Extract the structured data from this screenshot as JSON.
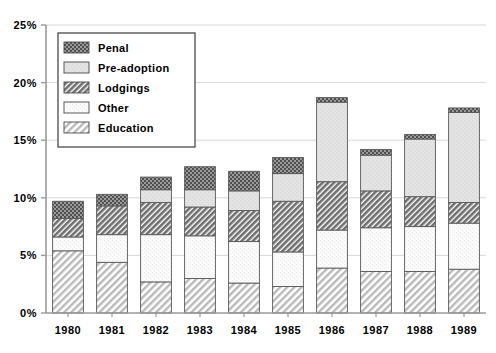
{
  "chart_data": {
    "type": "bar",
    "subtype": "stacked-vertical",
    "title": "",
    "xlabel": "",
    "ylabel": "",
    "categories": [
      "1980",
      "1981",
      "1982",
      "1983",
      "1984",
      "1985",
      "1986",
      "1987",
      "1988",
      "1989"
    ],
    "ylim": [
      0,
      25
    ],
    "ytick_labels": [
      "0%",
      "5%",
      "10%",
      "15%",
      "20%",
      "25%"
    ],
    "ytick_values": [
      0,
      5,
      10,
      15,
      20,
      25
    ],
    "yunit": "%",
    "grid": "horizontal",
    "legend_position": "upper-left-inside",
    "stack_order_bottom_to_top": [
      "Education",
      "Other",
      "Lodgings",
      "Pre-adoption",
      "Penal"
    ],
    "series": [
      {
        "name": "Education",
        "pattern": "diagonal-hatch-light",
        "color": "#d6d6d6",
        "values": [
          5.4,
          4.4,
          2.7,
          3.0,
          2.6,
          2.3,
          3.9,
          3.6,
          3.6,
          3.8
        ]
      },
      {
        "name": "Other",
        "pattern": "solid-white",
        "color": "#f7f7f7",
        "values": [
          1.2,
          2.4,
          4.1,
          3.7,
          3.6,
          3.0,
          3.3,
          3.8,
          3.9,
          4.0
        ]
      },
      {
        "name": "Lodgings",
        "pattern": "diagonal-hatch-dark",
        "color": "#8a8a8a",
        "values": [
          1.6,
          2.5,
          2.8,
          2.5,
          2.7,
          4.4,
          4.2,
          3.2,
          2.6,
          1.8
        ]
      },
      {
        "name": "Pre-adoption",
        "pattern": "solid-light-gray",
        "color": "#e2e2e2",
        "values": [
          0.0,
          0.0,
          1.1,
          1.5,
          1.7,
          2.4,
          6.9,
          3.1,
          5.0,
          7.8
        ]
      },
      {
        "name": "Penal",
        "pattern": "checker-dark",
        "color": "#737373",
        "values": [
          1.5,
          1.0,
          1.1,
          2.0,
          1.7,
          1.4,
          0.4,
          0.5,
          0.4,
          0.4
        ]
      }
    ],
    "totals": [
      9.7,
      10.3,
      11.8,
      12.7,
      12.3,
      13.5,
      18.7,
      14.2,
      15.5,
      17.8
    ]
  },
  "legend": {
    "items": [
      {
        "label": "Penal",
        "pattern": "checker-dark"
      },
      {
        "label": "Pre-adoption",
        "pattern": "solid-light-gray"
      },
      {
        "label": "Lodgings",
        "pattern": "diagonal-hatch-dark"
      },
      {
        "label": "Other",
        "pattern": "solid-white"
      },
      {
        "label": "Education",
        "pattern": "diagonal-hatch-light"
      }
    ]
  },
  "colors": {
    "axis": "#b0b0b0",
    "grid": "#d9d9d9",
    "text": "#000000",
    "bar_stroke": "#5a5a5a",
    "background": "#ffffff"
  }
}
